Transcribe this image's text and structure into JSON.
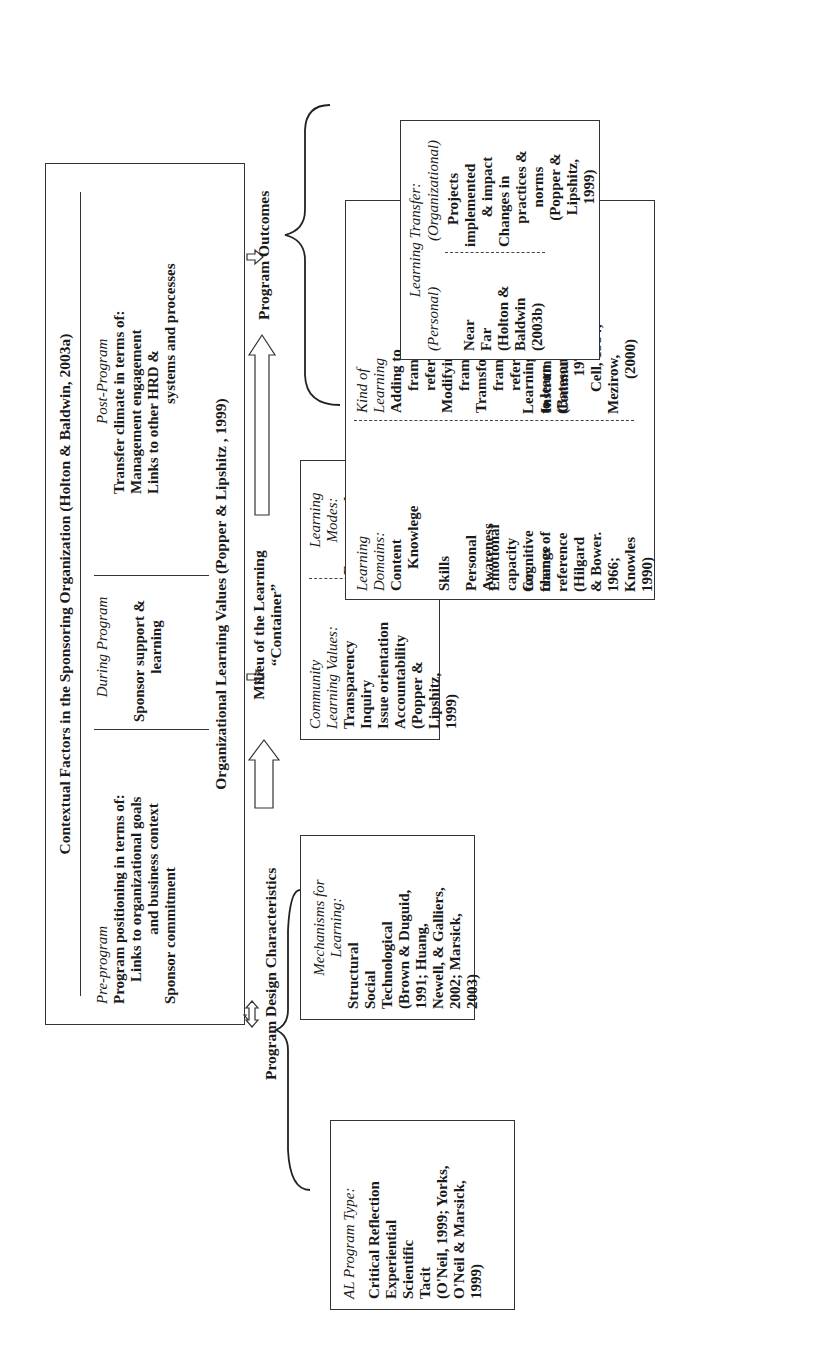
{
  "context": {
    "title": "Contextual Factors in the Sponsoring Organization (Holton & Baldwin, 2003a)",
    "pre_program": {
      "heading": "Pre-program",
      "lines": [
        "Program positioning in terms of:",
        "Links to organizational goals",
        "and business context",
        "Sponsor commitment"
      ]
    },
    "during_program": {
      "heading": "During Program",
      "lines": [
        "Sponsor support &",
        "learning"
      ]
    },
    "post_program": {
      "heading": "Post-Program",
      "lines": [
        "Transfer climate  in terms of:",
        "Management engagement",
        "Links to other HRD &",
        "systems and processes"
      ]
    },
    "org_values": "Organizational Learning Values (Popper & Lipshitz , 1999)"
  },
  "flow": {
    "design_label": "Program Design Characteristics",
    "milieu_label_1": "Milieu of the Learning",
    "milieu_label_2": "“Container”",
    "outcomes_label": "Program Outcomes"
  },
  "al_program_type": {
    "heading": "AL Program Type:",
    "items": [
      "Critical Reflection",
      "Experiential",
      "Scientific",
      "Tacit"
    ],
    "citation": [
      "(O'Neil, 1999; Yorks,",
      "O'Neil & Marsick,",
      "1999)"
    ]
  },
  "mechanisms": {
    "heading_1": "Mechanisms for",
    "heading_2": "Learning:",
    "items": [
      "Structural",
      "Social",
      "Technological"
    ],
    "citation": [
      "(Brown & Duguid,",
      "1991; Huang,",
      "Newell, & Galliers,",
      "2002;  Marsick,",
      "2003)"
    ]
  },
  "milieu_box": {
    "values_heading_1": "Community",
    "values_heading_2": "Learning Values:",
    "values_items": [
      "Transparency",
      "Inquiry",
      "Issue orientation",
      "Accountability",
      "(Popper &",
      "Lipshitz,",
      "1999)"
    ],
    "modes_heading_1": "Learning",
    "modes_heading_2": "Modes:",
    "modes_items": [
      "Fragmented",
      "Pooled",
      "Synergistic",
      "(Kasl,",
      "Marsick &",
      "Dechant,",
      "(1997)"
    ]
  },
  "learning_box": {
    "domains_heading_1": "Learning",
    "domains_heading_2": "Domains:",
    "domains": [
      [
        "Content",
        "Knowlege"
      ],
      [
        "Skills"
      ],
      [
        "Personal",
        "Awareness"
      ],
      [
        "Emotional",
        "capacity",
        "for",
        "change"
      ],
      [
        "Cognitive",
        "frames of",
        "reference",
        "(Hilgard",
        "& Bower.",
        "1966;",
        "Knowles",
        "1990)"
      ]
    ],
    "kind_heading_1": "Kind of",
    "kind_heading_2": "Learning",
    "kinds": [
      [
        "Adding to",
        "frames of",
        "reference",
        "Modifying",
        "frames of",
        "Tramsformed",
        "frames of",
        "reference"
      ],
      [
        "Instrumental",
        "Communicative"
      ],
      [
        "Learning",
        "to learn",
        "(Bateson,",
        "1972;",
        "Cell, 1984;",
        "Mezirow,",
        "(2000)"
      ]
    ]
  },
  "transfer_box": {
    "heading": "Learning Transfer:",
    "personal_heading": "(Personal)",
    "organizational_heading": "(Organizational)",
    "personal_items": [
      "Near",
      "Far",
      "(Holton &",
      "Baldwin",
      "(2003b)"
    ],
    "organizational_items": [
      "Projects",
      "implemented",
      "& impact",
      "Changes in",
      "practices &",
      "norms",
      "(Popper &",
      "Lipshitz,",
      "1999)"
    ]
  }
}
